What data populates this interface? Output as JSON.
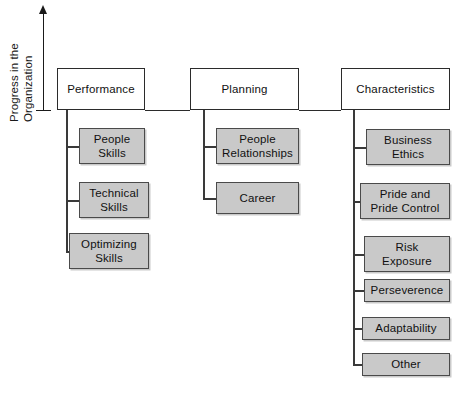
{
  "axis": {
    "label_line1": "Progress in the",
    "label_line2": "Organization",
    "arrow_icon": "up-arrow-icon"
  },
  "diagram": {
    "type": "tree",
    "columns": [
      {
        "id": "performance",
        "title": "Performance",
        "children": [
          {
            "label": "People\nSkills",
            "line1": "People",
            "line2": "Skills"
          },
          {
            "label": "Technical\nSkills",
            "line1": "Technical",
            "line2": "Skills"
          },
          {
            "label": "Optimizing\nSkills",
            "line1": "Optimizing",
            "line2": "Skills"
          }
        ]
      },
      {
        "id": "planning",
        "title": "Planning",
        "children": [
          {
            "label": "People\nRelationships",
            "line1": "People",
            "line2": "Relationships"
          },
          {
            "label": "Career",
            "line1": "Career",
            "line2": ""
          }
        ]
      },
      {
        "id": "characteristics",
        "title": "Characteristics",
        "children": [
          {
            "label": "Business\nEthics",
            "line1": "Business",
            "line2": "Ethics"
          },
          {
            "label": "Pride and\nPride Control",
            "line1": "Pride and",
            "line2": "Pride Control"
          },
          {
            "label": "Risk\nExposure",
            "line1": "Risk",
            "line2": "Exposure"
          },
          {
            "label": "Perseverence",
            "line1": "Perseverence",
            "line2": ""
          },
          {
            "label": "Adaptability",
            "line1": "Adaptability",
            "line2": ""
          },
          {
            "label": "Other",
            "line1": "Other",
            "line2": ""
          }
        ]
      }
    ]
  },
  "colors": {
    "child_fill": "#c9c9c9",
    "child_border": "#4a4a4a",
    "top_border": "#2b2b2b",
    "line": "#2b2b2b",
    "text": "#111111"
  }
}
